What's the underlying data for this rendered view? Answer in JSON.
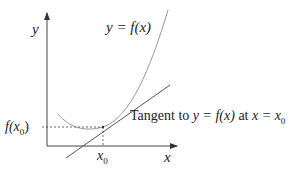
{
  "labels": {
    "y_axis": "y",
    "x_axis": "x",
    "curve": "y = f(x)",
    "f_x0": "f(x",
    "f_x0_sub": "0",
    "f_x0_close": ")",
    "x0": "x",
    "x0_sub": "0",
    "tangent_prefix": "Tangent to ",
    "tangent_eq": "y = f(x)",
    "tangent_at": " at ",
    "tangent_x": "x = x",
    "tangent_sub": "0"
  },
  "colors": {
    "axis": "#333333",
    "curve": "#999999",
    "tangent": "#444444"
  }
}
